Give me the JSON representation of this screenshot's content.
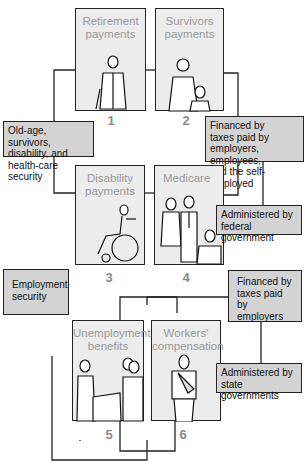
{
  "panels": [
    {
      "number": "1",
      "title_line1": "Retirement",
      "title_line2": "payments",
      "figure": "elderly-man-with-cane"
    },
    {
      "number": "2",
      "title_line1": "Survivors",
      "title_line2": "payments",
      "figure": "mother-and-child"
    },
    {
      "number": "3",
      "title_line1": "Disability",
      "title_line2": "payments",
      "figure": "person-in-wheelchair"
    },
    {
      "number": "4",
      "title_line1": "Medicare",
      "title_line2": "",
      "figure": "nurse-and-patients"
    },
    {
      "number": "5",
      "title_line1": "Unemployment",
      "title_line2": "benefits",
      "figure": "people-at-counter"
    },
    {
      "number": "6",
      "title_line1": "Workers'",
      "title_line2": "compensation",
      "figure": "man-with-arm-sling"
    }
  ],
  "notes": {
    "social_security_purpose": {
      "line1": "Old-age, survivors,",
      "line2": "disability, and",
      "line3": "health-care security"
    },
    "social_security_financing": {
      "line1": "Financed by",
      "line2": "taxes paid by",
      "line3": "employers, employees,",
      "line4": "and the self-employed"
    },
    "social_security_admin": {
      "line1": "Administered by",
      "line2": "federal government"
    },
    "employment_purpose": {
      "line1": "Employment",
      "line2": "security"
    },
    "employment_financing": {
      "line1": "Financed by",
      "line2": "taxes paid by",
      "line3": "employers"
    },
    "employment_admin": {
      "line1": "Administered by",
      "line2": "state governments"
    }
  },
  "colors": {
    "panel_fill": "#ececec",
    "note_fill": "#d3d3d3",
    "line": "#222222",
    "title_text": "#9a9a9a",
    "number_text": "#8a8a8a"
  }
}
